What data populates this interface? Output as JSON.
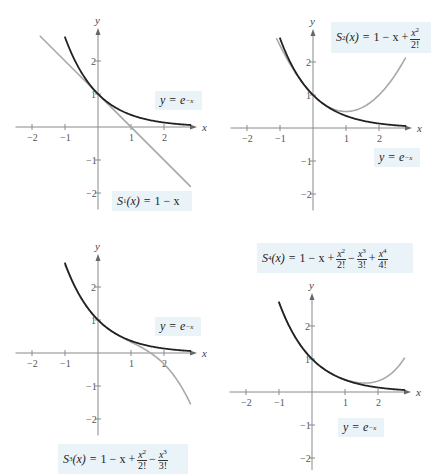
{
  "chart_data": [
    {
      "type": "line",
      "panel": 1,
      "origin_px": [
        98,
        127
      ],
      "unit_px": 33,
      "xlabel": "x",
      "ylabel": "y",
      "xticks": [
        "-2",
        "-1",
        "1",
        "2"
      ],
      "yticks": [
        "2",
        "1",
        "-1",
        "-2"
      ],
      "xlim": [
        -2.5,
        3
      ],
      "ylim": [
        -2.5,
        3
      ],
      "series": [
        {
          "name": "y = e^{-x}",
          "fn": "exp",
          "color": "#222222",
          "domain": [
            -1,
            2.8
          ]
        },
        {
          "name": "S1(x) = 1 - x",
          "fn": "s1",
          "color": "#a8a8a8",
          "domain": [
            -1.75,
            2.8
          ]
        }
      ],
      "labels": [
        {
          "id": "exp",
          "x": 155,
          "y": 91,
          "w": 47,
          "h": 19
        },
        {
          "id": "s1",
          "x": 112,
          "y": 191,
          "w": 80,
          "h": 20
        }
      ]
    },
    {
      "type": "line",
      "panel": 2,
      "origin_px": [
        313,
        128
      ],
      "unit_px": 33,
      "xlabel": "x",
      "ylabel": "y",
      "xticks": [
        "-2",
        "-1",
        "1",
        "2"
      ],
      "yticks": [
        "2",
        "1",
        "-1",
        "-2"
      ],
      "xlim": [
        -2.5,
        3
      ],
      "ylim": [
        -2.5,
        3
      ],
      "series": [
        {
          "name": "y = e^{-x}",
          "fn": "exp",
          "color": "#222222",
          "domain": [
            -1,
            2.8
          ]
        },
        {
          "name": "S2(x) = 1 - x + x^2/2!",
          "fn": "s2",
          "color": "#a8a8a8",
          "domain": [
            -1.1,
            2.8
          ]
        }
      ],
      "labels": [
        {
          "id": "exp",
          "x": 374,
          "y": 148,
          "w": 46,
          "h": 19
        },
        {
          "id": "s2",
          "x": 331,
          "y": 22,
          "w": 100,
          "h": 31
        }
      ]
    },
    {
      "type": "line",
      "panel": 3,
      "origin_px": [
        98,
        353
      ],
      "unit_px": 33,
      "xlabel": "x",
      "ylabel": "y",
      "xticks": [
        "-2",
        "-1",
        "1",
        "2"
      ],
      "yticks": [
        "2",
        "1",
        "-1",
        "-2"
      ],
      "xlim": [
        -2.5,
        3
      ],
      "ylim": [
        -2.5,
        3
      ],
      "series": [
        {
          "name": "y = e^{-x}",
          "fn": "exp",
          "color": "#222222",
          "domain": [
            -1,
            2.8
          ]
        },
        {
          "name": "S3(x) = 1 - x + x^2/2! - x^3/3!",
          "fn": "s3",
          "color": "#a8a8a8",
          "domain": [
            -1,
            2.8
          ]
        }
      ],
      "labels": [
        {
          "id": "exp",
          "x": 155,
          "y": 317,
          "w": 46,
          "h": 19
        },
        {
          "id": "s3",
          "x": 58,
          "y": 444,
          "w": 126,
          "h": 30
        }
      ]
    },
    {
      "type": "line",
      "panel": 4,
      "origin_px": [
        312,
        392
      ],
      "unit_px": 33,
      "xlabel": "x",
      "ylabel": "y",
      "xticks": [
        "-2",
        "-1",
        "1",
        "2"
      ],
      "yticks": [
        "2",
        "1",
        "-1",
        "-2"
      ],
      "xlim": [
        -2.5,
        3
      ],
      "ylim": [
        -2.5,
        3
      ],
      "series": [
        {
          "name": "y = e^{-x}",
          "fn": "exp",
          "color": "#222222",
          "domain": [
            -1,
            2.8
          ]
        },
        {
          "name": "S4(x) = 1 - x + x^2/2! - x^3/3! + x^4/4!",
          "fn": "s4",
          "color": "#a8a8a8",
          "domain": [
            -1,
            2.8
          ]
        }
      ],
      "labels": [
        {
          "id": "exp",
          "x": 338,
          "y": 418,
          "w": 46,
          "h": 19
        },
        {
          "id": "s4",
          "x": 257,
          "y": 243,
          "w": 156,
          "h": 30
        }
      ]
    }
  ],
  "labels": {
    "exp": {
      "lhs": "y",
      "eq": "=",
      "base": "e",
      "exp": "−x"
    },
    "s1": {
      "S": "S",
      "sub": "1",
      "arg": "(x)",
      "eq": "=",
      "rhs": "1 − x"
    },
    "s2": {
      "S": "S",
      "sub": "2",
      "arg": "(x)",
      "eq": "=",
      "rhs": "1 − x +",
      "n1": "x",
      "p1": "2",
      "d1": "2!"
    },
    "s3": {
      "S": "S",
      "sub": "3",
      "arg": "(x)",
      "eq": "=",
      "rhs": "1 − x +",
      "n1": "x",
      "p1": "2",
      "d1": "2!",
      "op2": "−",
      "n2": "x",
      "p2": "3",
      "d2": "3!"
    },
    "s4": {
      "S": "S",
      "sub": "4",
      "arg": "(x)",
      "eq": "=",
      "rhs": "1 − x +",
      "n1": "x",
      "p1": "2",
      "d1": "2!",
      "op2": "−",
      "n2": "x",
      "p2": "3",
      "d2": "3!",
      "op3": "+",
      "n3": "x",
      "p3": "4",
      "d3": "4!"
    }
  }
}
